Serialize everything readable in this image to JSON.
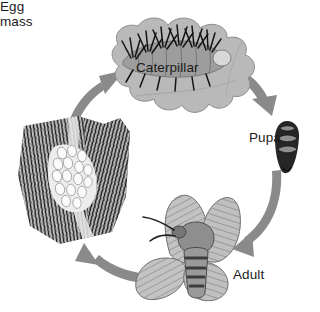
{
  "diagram": {
    "type": "cycle-diagram",
    "background_color": "#ffffff",
    "arrow_color": "#8a8a8a",
    "label_color": "#1c1c1c",
    "direction": "clockwise"
  },
  "stages": [
    {
      "id": "egg-mass",
      "label_line1": "Egg",
      "label_line2": "mass",
      "label": "Egg mass",
      "description": "egg mass on tree bark",
      "colors": {
        "bark": "#cfcfcf",
        "texture": "#1f1f1f",
        "eggs": "#f2f2f2"
      }
    },
    {
      "id": "caterpillar",
      "label": "Caterpillar",
      "description": "hairy caterpillar on a leaf",
      "colors": {
        "leaf": "#b7b7b7",
        "body": "#9a9a9a",
        "hairs": "#141414"
      }
    },
    {
      "id": "pupa",
      "label": "Pupa",
      "description": "dark segmented pupa",
      "colors": {
        "shell": "#2a2a2a",
        "segment": "#8e8e8e"
      }
    },
    {
      "id": "adult",
      "label": "Adult",
      "description": "adult moth with patterned wings",
      "colors": {
        "wing": "#bdbdbd",
        "veins": "#6e6e6e",
        "body": "#8c8c8c",
        "bands": "#4a4a4a"
      }
    }
  ],
  "arrows": [
    {
      "id": "arrow-egg-to-caterpillar",
      "from": "egg-mass",
      "to": "caterpillar"
    },
    {
      "id": "arrow-caterpillar-to-pupa",
      "from": "caterpillar",
      "to": "pupa"
    },
    {
      "id": "arrow-pupa-to-adult",
      "from": "pupa",
      "to": "adult"
    },
    {
      "id": "arrow-adult-to-egg",
      "from": "adult",
      "to": "egg-mass"
    }
  ]
}
